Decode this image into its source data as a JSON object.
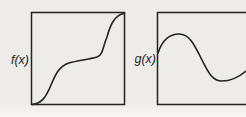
{
  "figure": {
    "f": {
      "label": "f(x)",
      "shape": "monotonic increasing S-curve from bottom-left corner to top-right corner with a plateau in the middle",
      "path": "M 32,104.5 C 42,103.5 46,97 51,85 C 55,75.5 59,66 69,63 C 78,60.5 88,59.5 97,57 C 103,55.5 103,46 107,37 C 109,30 113,14.5 124.5,13.5"
    },
    "g": {
      "label": "g(x)",
      "shape": "sine-like wave entering at mid-left with one crest near the top and one trough near the bottom, exiting right (box clipped at image edge)",
      "path": "M 158,53 C 161,44 167,34 179,34 C 190,34 195,46 202,60 C 208,71.5 212,81 222,81 C 232,81 239,77 246,71"
    }
  },
  "colors": {
    "background": "#eeece9",
    "line": "#232323",
    "label": "#1f1f1f"
  }
}
